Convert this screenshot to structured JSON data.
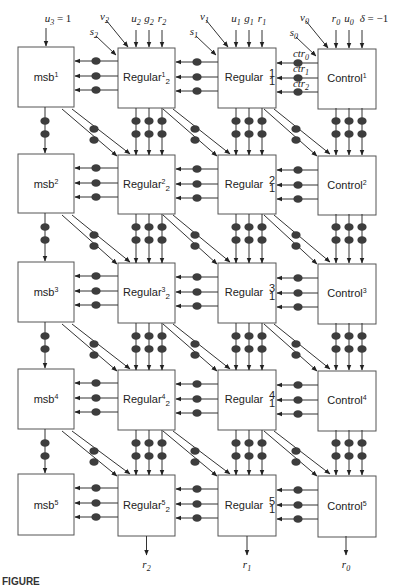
{
  "figure": {
    "caption_visible_fragment": "FIGURE",
    "columns": [
      {
        "id": "msb",
        "base_label": "msb"
      },
      {
        "id": "regular2",
        "base_label": "Regular",
        "subscript": "2"
      },
      {
        "id": "regular1",
        "base_label": "Regular",
        "subscript": "1"
      },
      {
        "id": "control",
        "base_label": "Control"
      }
    ],
    "rows": [
      {
        "index": "1",
        "msb": "msb",
        "msb_sup": "1",
        "reg2": "Regular",
        "reg2_sup": "1",
        "reg2_sub": "2",
        "reg1": "Regular",
        "reg1_sup": "1",
        "reg1_sub": "1",
        "control": "Control",
        "control_sup": "1"
      },
      {
        "index": "2",
        "msb": "msb",
        "msb_sup": "2",
        "reg2": "Regular",
        "reg2_sup": "2",
        "reg2_sub": "2",
        "reg1": "Regular",
        "reg1_sup": "2",
        "reg1_sub": "1",
        "control": "Control",
        "control_sup": "2"
      },
      {
        "index": "3",
        "msb": "msb",
        "msb_sup": "3",
        "reg2": "Regular",
        "reg2_sup": "3",
        "reg2_sub": "2",
        "reg1": "Regular",
        "reg1_sup": "3",
        "reg1_sub": "1",
        "control": "Control",
        "control_sup": "3"
      },
      {
        "index": "4",
        "msb": "msb",
        "msb_sup": "4",
        "reg2": "Regular",
        "reg2_sup": "4",
        "reg2_sub": "2",
        "reg1": "Regular",
        "reg1_sup": "4",
        "reg1_sub": "1",
        "control": "Control",
        "control_sup": "4"
      },
      {
        "index": "5",
        "msb": "msb",
        "msb_sup": "5",
        "reg2": "Regular",
        "reg2_sup": "5",
        "reg2_sub": "2",
        "reg1": "Regular",
        "reg1_sup": "5",
        "reg1_sub": "1",
        "control": "Control",
        "control_sup": "5"
      }
    ],
    "top_inputs": {
      "msb": {
        "var": "u",
        "sub": "3",
        "rest": " = 1"
      },
      "reg2": {
        "diag1_var": "s",
        "diag1_sub": "2",
        "diag2_var": "v",
        "diag2_sub": "2",
        "vert": [
          {
            "var": "u",
            "sub": "2"
          },
          {
            "var": "g",
            "sub": "2"
          },
          {
            "var": "r",
            "sub": "2"
          }
        ]
      },
      "reg1": {
        "diag1_var": "s",
        "diag1_sub": "1",
        "diag2_var": "v",
        "diag2_sub": "1",
        "vert": [
          {
            "var": "u",
            "sub": "1"
          },
          {
            "var": "g",
            "sub": "1"
          },
          {
            "var": "r",
            "sub": "1"
          }
        ]
      },
      "control": {
        "diag1_var": "s",
        "diag1_sub": "0",
        "diag2_var": "v",
        "diag2_sub": "0",
        "vert": [
          {
            "var": "r",
            "sub": "0"
          },
          {
            "var": "u",
            "sub": "0"
          },
          {
            "var": "δ",
            "sub": "",
            "rest": " = −1"
          }
        ]
      }
    },
    "control_signals": [
      {
        "var": "ctr",
        "sub": "0"
      },
      {
        "var": "ctr",
        "sub": "1"
      },
      {
        "var": "ctr",
        "sub": "2"
      }
    ],
    "bottom_outputs": [
      {
        "var": "r",
        "sub": "2"
      },
      {
        "var": "r",
        "sub": "1"
      },
      {
        "var": "r",
        "sub": "0"
      }
    ],
    "colors": {
      "box_stroke": "#555555",
      "line": "#333333",
      "register_dot": "#3d3d3d",
      "background": "#ffffff"
    }
  }
}
